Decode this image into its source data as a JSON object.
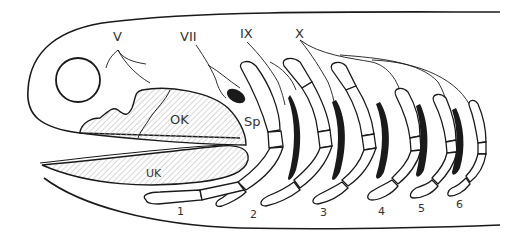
{
  "figure": {
    "type": "anatomical line drawing",
    "colors": {
      "line": "#1a1a1a",
      "fill_dark": "#1a1a1a",
      "hatch": "#bfbfbf",
      "background": "#ffffff"
    }
  },
  "labels": {
    "nerves": {
      "V": "V",
      "VII": "VII",
      "IX": "IX",
      "X": "X"
    },
    "structures": {
      "ok": "OK",
      "uk": "UK",
      "sp": "Sp"
    },
    "arches": [
      "1",
      "2",
      "3",
      "4",
      "5",
      "6"
    ]
  }
}
